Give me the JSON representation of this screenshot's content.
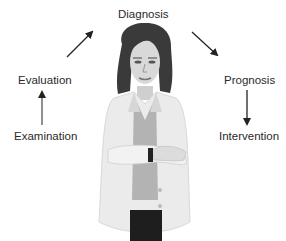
{
  "diagram": {
    "title": "",
    "type": "clinical-process-cycle",
    "steps": [
      {
        "id": "examination",
        "label": "Examination"
      },
      {
        "id": "evaluation",
        "label": "Evaluation"
      },
      {
        "id": "diagnosis",
        "label": "Diagnosis"
      },
      {
        "id": "prognosis",
        "label": "Prognosis"
      },
      {
        "id": "intervention",
        "label": "Intervention"
      }
    ],
    "flow": [
      {
        "from": "examination",
        "to": "evaluation"
      },
      {
        "from": "evaluation",
        "to": "diagnosis"
      },
      {
        "from": "diagnosis",
        "to": "prognosis"
      },
      {
        "from": "prognosis",
        "to": "intervention"
      }
    ],
    "center_illustration": "clinician-in-white-coat",
    "colors": {
      "text": "#2a2a2a",
      "arrow": "#222222",
      "coat": "#e8e8e8",
      "hair": "#3a3a3a",
      "shirt": "#a9a9a9",
      "pants": "#1e1e1e",
      "background": "#ffffff"
    }
  }
}
